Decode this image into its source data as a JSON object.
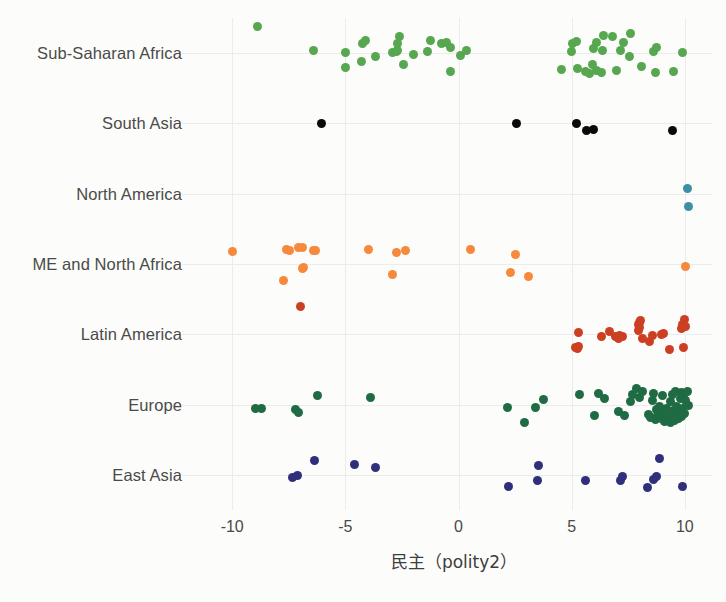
{
  "chart_data": {
    "type": "scatter",
    "title": "",
    "subtitle": "",
    "xlabel": "民主（polity2）",
    "ylabel": "",
    "xlim": [
      -11.6,
      11.2
    ],
    "xticks": [
      -10,
      -5,
      0,
      5,
      10
    ],
    "xticklabels": [
      "-10",
      "-5",
      "0",
      "5",
      "10"
    ],
    "categories": [
      "Sub-Saharan Africa",
      "South Asia",
      "North America",
      "ME and North Africa",
      "Latin America",
      "Europe",
      "East Asia"
    ],
    "grid": true,
    "legend": "none",
    "marker_size": 9,
    "series": [
      {
        "name": "Sub-Saharan Africa",
        "color": "#56a74f",
        "category_index": 0,
        "points": [
          [
            -8.9,
            -0.6
          ],
          [
            -6.4,
            -0.05
          ],
          [
            -5.0,
            0.33
          ],
          [
            -5.0,
            -0.02
          ],
          [
            -4.3,
            0.2
          ],
          [
            -4.25,
            -0.23
          ],
          [
            -4.1,
            -0.3
          ],
          [
            -3.65,
            0.08
          ],
          [
            -2.9,
            -0.02
          ],
          [
            -2.75,
            -0.03
          ],
          [
            -2.7,
            -0.06
          ],
          [
            -2.7,
            -0.22
          ],
          [
            -2.6,
            -0.38
          ],
          [
            -2.45,
            0.26
          ],
          [
            -2.0,
            0.03
          ],
          [
            -1.35,
            -0.03
          ],
          [
            -1.25,
            -0.3
          ],
          [
            -0.75,
            -0.22
          ],
          [
            -0.55,
            -0.24
          ],
          [
            -0.35,
            0.43
          ],
          [
            -0.35,
            -0.13
          ],
          [
            0.1,
            0.06
          ],
          [
            0.35,
            -0.05
          ],
          [
            4.55,
            0.38
          ],
          [
            5.0,
            -0.03
          ],
          [
            5.05,
            -0.22
          ],
          [
            5.2,
            -0.26
          ],
          [
            5.25,
            0.35
          ],
          [
            5.6,
            0.43
          ],
          [
            5.8,
            0.46
          ],
          [
            5.9,
            0.26
          ],
          [
            5.95,
            -0.1
          ],
          [
            6.1,
            0.39
          ],
          [
            6.1,
            -0.24
          ],
          [
            6.3,
            0.45
          ],
          [
            6.35,
            -0.07
          ],
          [
            6.4,
            -0.4
          ],
          [
            6.8,
            -0.38
          ],
          [
            7.0,
            0.4
          ],
          [
            7.15,
            -0.05
          ],
          [
            7.3,
            -0.24
          ],
          [
            7.55,
            0.08
          ],
          [
            7.6,
            -0.46
          ],
          [
            8.1,
            0.3
          ],
          [
            8.6,
            -0.03
          ],
          [
            8.7,
            0.45
          ],
          [
            8.75,
            -0.12
          ],
          [
            9.5,
            0.42
          ],
          [
            9.9,
            -0.02
          ]
        ]
      },
      {
        "name": "South Asia",
        "color": "#0a0a0a",
        "category_index": 1,
        "points": [
          [
            -6.05,
            0.0
          ],
          [
            2.55,
            0.0
          ],
          [
            5.2,
            0.0
          ],
          [
            5.65,
            0.16
          ],
          [
            5.95,
            0.14
          ],
          [
            9.45,
            0.16
          ]
        ]
      },
      {
        "name": "North America",
        "color": "#3e8fa6",
        "category_index": 2,
        "points": [
          [
            10.15,
            0.3
          ],
          [
            10.1,
            -0.13
          ]
        ]
      },
      {
        "name": "ME and North Africa",
        "color": "#f6893c",
        "category_index": 3,
        "points": [
          [
            -10.0,
            -0.28
          ],
          [
            -7.75,
            0.37
          ],
          [
            -7.6,
            -0.33
          ],
          [
            -7.45,
            -0.3
          ],
          [
            -7.05,
            -0.39
          ],
          [
            -6.9,
            -0.38
          ],
          [
            -6.9,
            0.1
          ],
          [
            -6.85,
            0.07
          ],
          [
            -6.4,
            -0.3
          ],
          [
            -6.3,
            -0.32
          ],
          [
            -4.0,
            -0.33
          ],
          [
            -2.9,
            0.24
          ],
          [
            -2.75,
            -0.27
          ],
          [
            -2.35,
            -0.3
          ],
          [
            0.55,
            -0.33
          ],
          [
            2.3,
            0.2
          ],
          [
            2.5,
            -0.22
          ],
          [
            3.1,
            0.28
          ],
          [
            10.05,
            0.05
          ]
        ]
      },
      {
        "name": "Latin America",
        "color": "#cc3f22",
        "category_index": 4,
        "points": [
          [
            -7.0,
            -0.63
          ],
          [
            5.15,
            0.3
          ],
          [
            5.25,
            0.33
          ],
          [
            5.3,
            0.27
          ],
          [
            5.3,
            -0.04
          ],
          [
            6.3,
            0.04
          ],
          [
            6.65,
            -0.06
          ],
          [
            6.95,
            0.06
          ],
          [
            7.05,
            0.09
          ],
          [
            7.1,
            0.02
          ],
          [
            7.25,
            0.04
          ],
          [
            7.95,
            -0.09
          ],
          [
            7.95,
            -0.22
          ],
          [
            8.0,
            -0.27
          ],
          [
            8.0,
            -0.16
          ],
          [
            8.05,
            -0.31
          ],
          [
            8.15,
            0.1
          ],
          [
            8.45,
            0.17
          ],
          [
            8.55,
            0.02
          ],
          [
            8.95,
            0.0
          ],
          [
            9.05,
            -0.02
          ],
          [
            9.3,
            0.36
          ],
          [
            9.85,
            -0.14
          ],
          [
            9.9,
            -0.22
          ],
          [
            9.95,
            0.31
          ],
          [
            10.0,
            -0.33
          ],
          [
            10.05,
            -0.18
          ]
        ]
      },
      {
        "name": "Europe",
        "color": "#1f6b43",
        "category_index": 5,
        "points": [
          [
            -8.95,
            0.1
          ],
          [
            -8.7,
            0.09
          ],
          [
            -7.2,
            0.12
          ],
          [
            -7.05,
            0.18
          ],
          [
            -6.25,
            -0.2
          ],
          [
            -3.9,
            -0.16
          ],
          [
            2.15,
            0.06
          ],
          [
            2.9,
            0.4
          ],
          [
            3.4,
            0.06
          ],
          [
            3.75,
            -0.12
          ],
          [
            5.35,
            -0.22
          ],
          [
            6.0,
            0.25
          ],
          [
            6.2,
            -0.26
          ],
          [
            6.45,
            -0.13
          ],
          [
            7.05,
            0.17
          ],
          [
            7.35,
            0.25
          ],
          [
            7.6,
            -0.08
          ],
          [
            7.7,
            -0.22
          ],
          [
            7.85,
            -0.38
          ],
          [
            8.0,
            -0.17
          ],
          [
            8.15,
            -0.29
          ],
          [
            8.4,
            0.22
          ],
          [
            8.5,
            0.3
          ],
          [
            8.55,
            -0.1
          ],
          [
            8.6,
            -0.26
          ],
          [
            8.7,
            0.34
          ],
          [
            8.75,
            0.12
          ],
          [
            8.8,
            0.26
          ],
          [
            8.9,
            0.05
          ],
          [
            8.95,
            0.33
          ],
          [
            9.0,
            -0.2
          ],
          [
            9.05,
            0.18
          ],
          [
            9.1,
            0.38
          ],
          [
            9.15,
            0.28
          ],
          [
            9.2,
            0.08
          ],
          [
            9.25,
            0.35
          ],
          [
            9.3,
            0.2
          ],
          [
            9.35,
            0.41
          ],
          [
            9.35,
            -0.06
          ],
          [
            9.4,
            0.3
          ],
          [
            9.45,
            -0.24
          ],
          [
            9.5,
            0.13
          ],
          [
            9.55,
            0.36
          ],
          [
            9.6,
            0.24
          ],
          [
            9.6,
            -0.31
          ],
          [
            9.65,
            0.05
          ],
          [
            9.7,
            0.32
          ],
          [
            9.75,
            0.17
          ],
          [
            9.8,
            -0.14
          ],
          [
            9.85,
            0.27
          ],
          [
            9.85,
            -0.28
          ],
          [
            9.9,
            0.09
          ],
          [
            9.95,
            -0.21
          ],
          [
            10.0,
            0.21
          ],
          [
            10.05,
            -0.09
          ],
          [
            10.1,
            -0.3
          ],
          [
            10.15,
            0.02
          ]
        ]
      },
      {
        "name": "East Asia",
        "color": "#2f2f7c",
        "category_index": 6,
        "points": [
          [
            -7.35,
            0.06
          ],
          [
            -7.1,
            0.01
          ],
          [
            -6.35,
            -0.33
          ],
          [
            -4.6,
            -0.24
          ],
          [
            -3.65,
            -0.18
          ],
          [
            2.2,
            0.26
          ],
          [
            3.5,
            0.13
          ],
          [
            3.55,
            -0.21
          ],
          [
            5.6,
            0.14
          ],
          [
            7.15,
            0.12
          ],
          [
            7.25,
            0.03
          ],
          [
            8.35,
            0.3
          ],
          [
            8.6,
            0.1
          ],
          [
            8.75,
            0.03
          ],
          [
            8.9,
            -0.38
          ],
          [
            9.9,
            0.26
          ]
        ]
      }
    ]
  },
  "axis": {
    "x_title": "民主（polity2）",
    "x_ticks": [
      "-10",
      "-5",
      "0",
      "5",
      "10"
    ],
    "y_labels": [
      "Sub-Saharan Africa",
      "South Asia",
      "North America",
      "ME and North Africa",
      "Latin America",
      "Europe",
      "East Asia"
    ]
  },
  "style": {
    "background": "#fcfcfb",
    "gridline_color": "#ececeb",
    "text_color": "#4a4a48"
  }
}
